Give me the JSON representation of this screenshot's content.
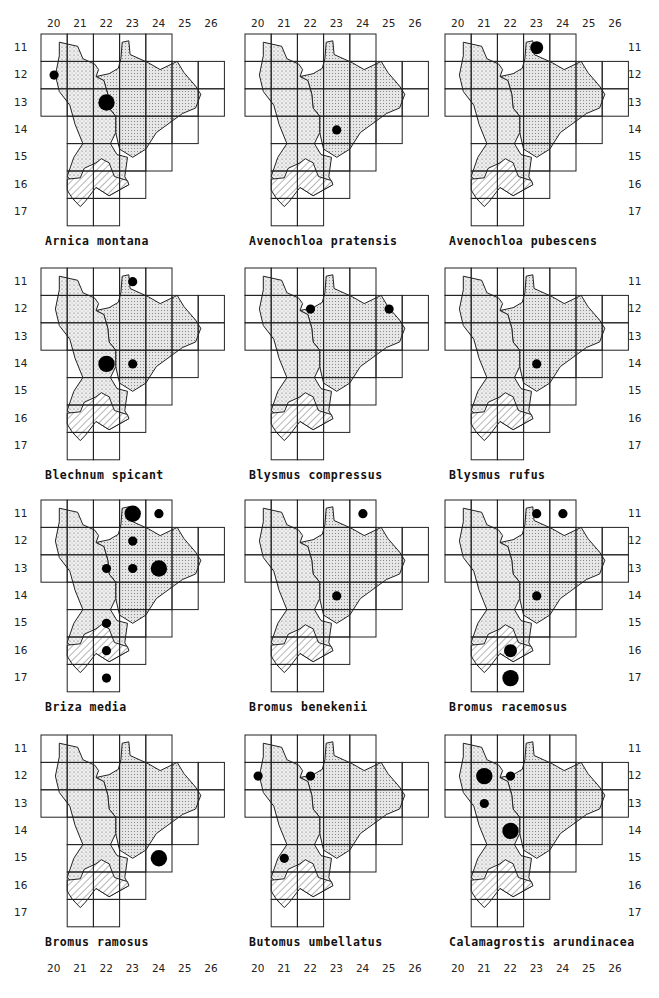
{
  "page": {
    "page_number_partial": "..."
  },
  "axes": {
    "columns": [
      "20",
      "21",
      "22",
      "23",
      "24",
      "25",
      "26"
    ],
    "rows": [
      "11",
      "12",
      "13",
      "14",
      "15",
      "16",
      "17"
    ]
  },
  "legend_hatching": {
    "fine_stipple": "western region (stippled)",
    "grid_dots": "eastern region (dot-grid)",
    "hatched": "southern region (hatched)"
  },
  "chart_data": {
    "type": "scatter",
    "xlabel": "Grid column",
    "ylabel": "Grid row",
    "x_ticks": [
      20,
      21,
      22,
      23,
      24,
      25,
      26
    ],
    "y_ticks": [
      11,
      12,
      13,
      14,
      15,
      16,
      17
    ],
    "note": "Dot size: small / medium / large (frequency class)",
    "maps": [
      {
        "species": "Arnica montana",
        "dots": [
          {
            "col": 20,
            "row": 12,
            "size": "small"
          },
          {
            "col": 22,
            "row": 13,
            "size": "large"
          }
        ]
      },
      {
        "species": "Avenochloa pratensis",
        "dots": [
          {
            "col": 23,
            "row": 14,
            "size": "small"
          }
        ]
      },
      {
        "species": "Avenochloa pubescens",
        "dots": [
          {
            "col": 23,
            "row": 11,
            "size": "medium"
          }
        ]
      },
      {
        "species": "Blechnum spicant",
        "dots": [
          {
            "col": 23,
            "row": 11,
            "size": "small"
          },
          {
            "col": 22,
            "row": 14,
            "size": "large"
          },
          {
            "col": 23,
            "row": 14,
            "size": "small"
          }
        ]
      },
      {
        "species": "Blysmus compressus",
        "dots": [
          {
            "col": 22,
            "row": 12,
            "size": "small"
          },
          {
            "col": 25,
            "row": 12,
            "size": "small"
          }
        ]
      },
      {
        "species": "Blysmus rufus",
        "dots": [
          {
            "col": 23,
            "row": 14,
            "size": "small"
          }
        ]
      },
      {
        "species": "Briza media",
        "dots": [
          {
            "col": 23,
            "row": 11,
            "size": "large"
          },
          {
            "col": 24,
            "row": 11,
            "size": "small"
          },
          {
            "col": 23,
            "row": 12,
            "size": "small"
          },
          {
            "col": 22,
            "row": 13,
            "size": "small"
          },
          {
            "col": 23,
            "row": 13,
            "size": "small"
          },
          {
            "col": 24,
            "row": 13,
            "size": "large"
          },
          {
            "col": 22,
            "row": 15,
            "size": "small"
          },
          {
            "col": 22,
            "row": 16,
            "size": "small"
          },
          {
            "col": 22,
            "row": 17,
            "size": "small"
          }
        ]
      },
      {
        "species": "Bromus benekenii",
        "dots": [
          {
            "col": 24,
            "row": 11,
            "size": "small"
          },
          {
            "col": 23,
            "row": 14,
            "size": "small"
          }
        ]
      },
      {
        "species": "Bromus racemosus",
        "dots": [
          {
            "col": 23,
            "row": 11,
            "size": "small"
          },
          {
            "col": 24,
            "row": 11,
            "size": "small"
          },
          {
            "col": 23,
            "row": 14,
            "size": "small"
          },
          {
            "col": 22,
            "row": 16,
            "size": "medium"
          },
          {
            "col": 22,
            "row": 17,
            "size": "large"
          }
        ]
      },
      {
        "species": "Bromus ramosus",
        "dots": [
          {
            "col": 24,
            "row": 15,
            "size": "large"
          }
        ]
      },
      {
        "species": "Butomus umbellatus",
        "dots": [
          {
            "col": 20,
            "row": 12,
            "size": "small"
          },
          {
            "col": 22,
            "row": 12,
            "size": "small"
          },
          {
            "col": 21,
            "row": 15,
            "size": "small"
          }
        ]
      },
      {
        "species": "Calamagrostis arundinacea",
        "dots": [
          {
            "col": 21,
            "row": 12,
            "size": "large"
          },
          {
            "col": 22,
            "row": 12,
            "size": "small"
          },
          {
            "col": 21,
            "row": 13,
            "size": "small"
          },
          {
            "col": 22,
            "row": 14,
            "size": "large"
          }
        ]
      }
    ]
  }
}
